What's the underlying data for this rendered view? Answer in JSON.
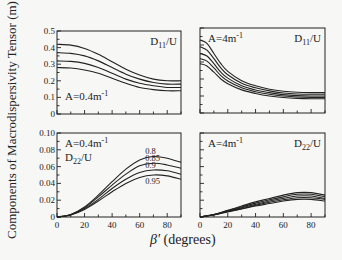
{
  "figure": {
    "ylabel": "Components of Macrodispersivity Tensor (m)",
    "xlabel_symbol": "β'",
    "xlabel_unit": "(degrees)"
  },
  "chart_data": [
    {
      "type": "line",
      "panel": "top-left",
      "title": "D11/U",
      "annotation": "A=0.4m⁻¹",
      "xlabel": "β' (degrees)",
      "ylabel": "Components of Macrodispersivity Tensor (m)",
      "xlim": [
        0,
        90
      ],
      "ylim": [
        0,
        0.5
      ],
      "yticks": [
        "0",
        "0.1",
        "0.2",
        "0.3",
        "0.4",
        "0.5"
      ],
      "x": [
        0,
        10,
        20,
        30,
        40,
        50,
        60,
        70,
        80,
        90
      ],
      "series": [
        {
          "name": "0.8",
          "values": [
            0.42,
            0.415,
            0.395,
            0.36,
            0.315,
            0.27,
            0.235,
            0.21,
            0.2,
            0.2
          ]
        },
        {
          "name": "0.85",
          "values": [
            0.37,
            0.365,
            0.35,
            0.32,
            0.28,
            0.24,
            0.21,
            0.19,
            0.18,
            0.18
          ]
        },
        {
          "name": "0.9",
          "values": [
            0.32,
            0.317,
            0.305,
            0.28,
            0.245,
            0.21,
            0.185,
            0.17,
            0.16,
            0.16
          ]
        },
        {
          "name": "0.95",
          "values": [
            0.28,
            0.277,
            0.265,
            0.245,
            0.215,
            0.185,
            0.16,
            0.147,
            0.14,
            0.14
          ]
        }
      ]
    },
    {
      "type": "line",
      "panel": "top-right",
      "title": "D11/U",
      "annotation": "A=4m⁻¹",
      "xlim": [
        0,
        90
      ],
      "ylim": [
        0,
        0.5
      ],
      "x": [
        0,
        5,
        10,
        15,
        20,
        30,
        40,
        50,
        60,
        70,
        80,
        90
      ],
      "series": [
        {
          "name": "s1",
          "values": [
            0.43,
            0.41,
            0.35,
            0.29,
            0.245,
            0.19,
            0.16,
            0.14,
            0.128,
            0.122,
            0.12,
            0.12
          ]
        },
        {
          "name": "s2",
          "values": [
            0.39,
            0.37,
            0.32,
            0.265,
            0.225,
            0.175,
            0.148,
            0.13,
            0.118,
            0.112,
            0.11,
            0.11
          ]
        },
        {
          "name": "s3",
          "values": [
            0.35,
            0.335,
            0.29,
            0.24,
            0.205,
            0.16,
            0.135,
            0.12,
            0.108,
            0.102,
            0.1,
            0.1
          ]
        },
        {
          "name": "s4",
          "values": [
            0.32,
            0.305,
            0.265,
            0.22,
            0.188,
            0.148,
            0.125,
            0.11,
            0.1,
            0.094,
            0.092,
            0.092
          ]
        },
        {
          "name": "s5",
          "values": [
            0.29,
            0.277,
            0.24,
            0.2,
            0.172,
            0.136,
            0.115,
            0.1,
            0.091,
            0.086,
            0.084,
            0.084
          ]
        }
      ]
    },
    {
      "type": "line",
      "panel": "bottom-left",
      "title": "D22/U",
      "annotation": "A=0.4m⁻¹",
      "xlim": [
        0,
        90
      ],
      "ylim": [
        0,
        0.1
      ],
      "xticks": [
        "0",
        "20",
        "40",
        "60",
        "80"
      ],
      "yticks": [
        "0",
        "0.02",
        "0.04",
        "0.06",
        "0.08",
        "0.10"
      ],
      "x": [
        0,
        10,
        20,
        30,
        40,
        50,
        60,
        70,
        80,
        90
      ],
      "series": [
        {
          "name": "0.8",
          "values": [
            0,
            0.003,
            0.012,
            0.026,
            0.042,
            0.057,
            0.068,
            0.072,
            0.07,
            0.065
          ]
        },
        {
          "name": "0.85",
          "values": [
            0,
            0.0028,
            0.011,
            0.024,
            0.038,
            0.051,
            0.061,
            0.064,
            0.062,
            0.058
          ]
        },
        {
          "name": "0.9",
          "values": [
            0,
            0.0026,
            0.01,
            0.021,
            0.034,
            0.045,
            0.053,
            0.056,
            0.055,
            0.051
          ]
        },
        {
          "name": "0.95",
          "values": [
            0,
            0.0024,
            0.009,
            0.019,
            0.03,
            0.04,
            0.047,
            0.05,
            0.049,
            0.045
          ]
        }
      ]
    },
    {
      "type": "line",
      "panel": "bottom-right",
      "title": "D22/U",
      "annotation": "A=4m⁻¹",
      "xlim": [
        0,
        90
      ],
      "ylim": [
        0,
        0.1
      ],
      "xticks": [
        "0",
        "20",
        "40",
        "60",
        "80"
      ],
      "x": [
        0,
        10,
        20,
        30,
        40,
        50,
        60,
        70,
        80,
        90
      ],
      "series": [
        {
          "name": "s1",
          "values": [
            0,
            0.003,
            0.008,
            0.013,
            0.018,
            0.022,
            0.026,
            0.029,
            0.029,
            0.026
          ]
        },
        {
          "name": "s2",
          "values": [
            0,
            0.003,
            0.0075,
            0.012,
            0.0165,
            0.0205,
            0.024,
            0.027,
            0.027,
            0.024
          ]
        },
        {
          "name": "s3",
          "values": [
            0,
            0.0028,
            0.007,
            0.011,
            0.015,
            0.019,
            0.022,
            0.025,
            0.025,
            0.022
          ]
        },
        {
          "name": "s4",
          "values": [
            0,
            0.0026,
            0.0065,
            0.01,
            0.014,
            0.0175,
            0.0205,
            0.023,
            0.023,
            0.021
          ]
        },
        {
          "name": "s5",
          "values": [
            0,
            0.0024,
            0.006,
            0.0095,
            0.013,
            0.016,
            0.019,
            0.021,
            0.021,
            0.019
          ]
        }
      ]
    }
  ]
}
